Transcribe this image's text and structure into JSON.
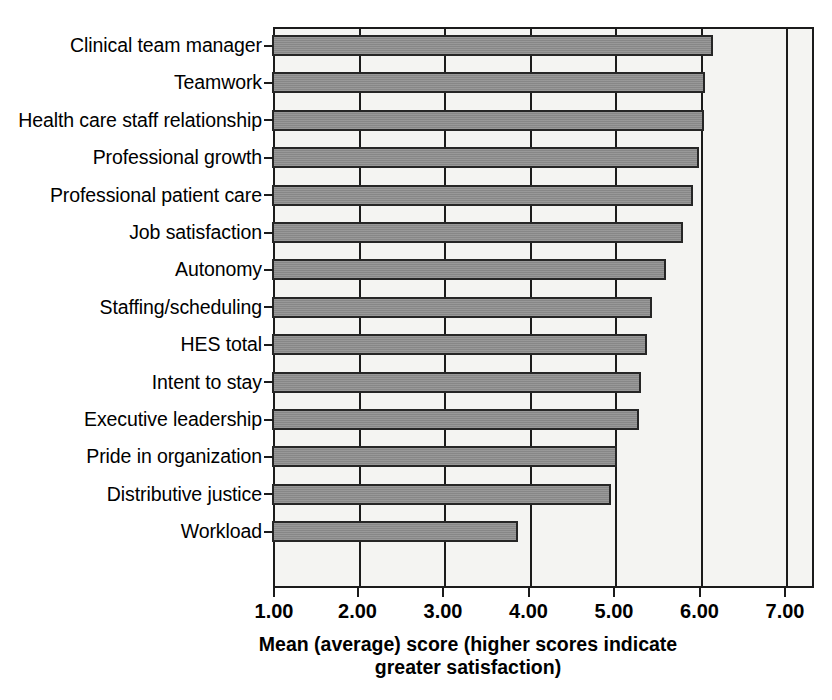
{
  "chart_data": {
    "type": "bar",
    "orientation": "horizontal",
    "title": "",
    "xlabel": "Mean (average) score (higher scores indicate greater satisfaction)",
    "xlabel_line1": "Mean (average) score (higher scores indicate",
    "xlabel_line2": "greater satisfaction)",
    "ylabel": "",
    "categories": [
      "Clinical team manager",
      "Teamwork",
      "Health care staff relationship",
      "Professional growth",
      "Professional patient care",
      "Job satisfaction",
      "Autonomy",
      "Staffing/scheduling",
      "HES total",
      "Intent to stay",
      "Executive leadership",
      "Pride in organization",
      "Distributive justice",
      "Workload"
    ],
    "values": [
      6.15,
      6.05,
      6.04,
      5.98,
      5.91,
      5.8,
      5.6,
      5.43,
      5.38,
      5.31,
      5.28,
      5.03,
      4.96,
      3.87
    ],
    "xlim": [
      1.0,
      7.33
    ],
    "xticks": [
      1.0,
      2.0,
      3.0,
      4.0,
      5.0,
      6.0,
      7.0
    ],
    "xticklabels": [
      "1.00",
      "2.00",
      "3.00",
      "4.00",
      "5.00",
      "6.00",
      "7.00"
    ],
    "grid": true,
    "grid_axis": "x",
    "legend": null,
    "bar_color": "#8d8d8d",
    "bar_edge_color": "#262626",
    "plot_background": "#f4f4f2",
    "axis_color": "#1b1b1b"
  }
}
